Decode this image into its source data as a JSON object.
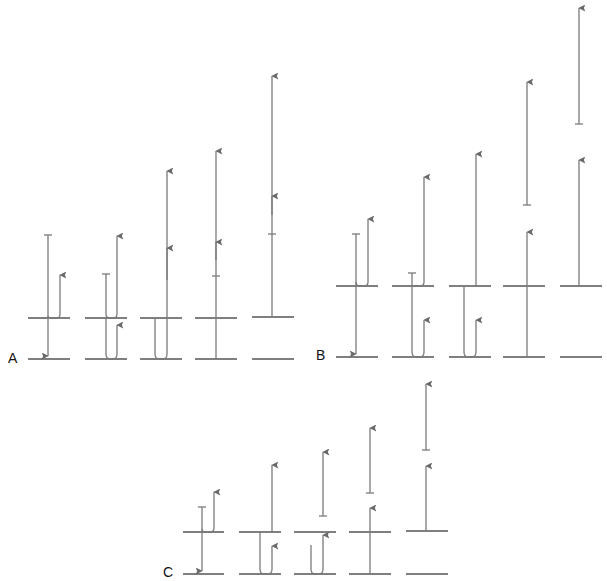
{
  "figure": {
    "panels": [
      {
        "id": "A",
        "label": "A",
        "columns": 5,
        "levels": [
          "ground",
          "upper"
        ]
      },
      {
        "id": "B",
        "label": "B",
        "columns": 5,
        "levels": [
          "ground",
          "upper"
        ]
      },
      {
        "id": "C",
        "label": "C",
        "columns": 5,
        "levels": [
          "ground",
          "upper"
        ]
      }
    ],
    "colors": {
      "level_line": "#555555",
      "transition_line": "#7a7a7a",
      "background": "#ffffff"
    },
    "icons": {
      "arrow_up": "arrowhead-up-icon",
      "arrow_down": "arrowhead-down-icon",
      "bar_end": "t-bar-icon"
    }
  }
}
